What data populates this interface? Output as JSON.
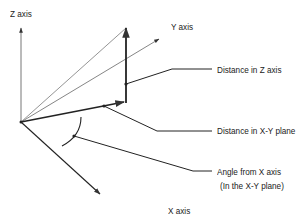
{
  "diagram": {
    "type": "3D coordinate diagram",
    "labels": {
      "z_axis": "Z axis",
      "y_axis": "Y axis",
      "x_axis": "X axis",
      "distance_z": "Distance in Z axis",
      "distance_xy": "Distance in X-Y plane",
      "angle_line1": "Angle from X axis",
      "angle_line2": "(In the X-Y plane)"
    },
    "colors": {
      "line": "#222222",
      "thin_line": "#777777",
      "text": "#222222",
      "background": "#ffffff"
    }
  }
}
